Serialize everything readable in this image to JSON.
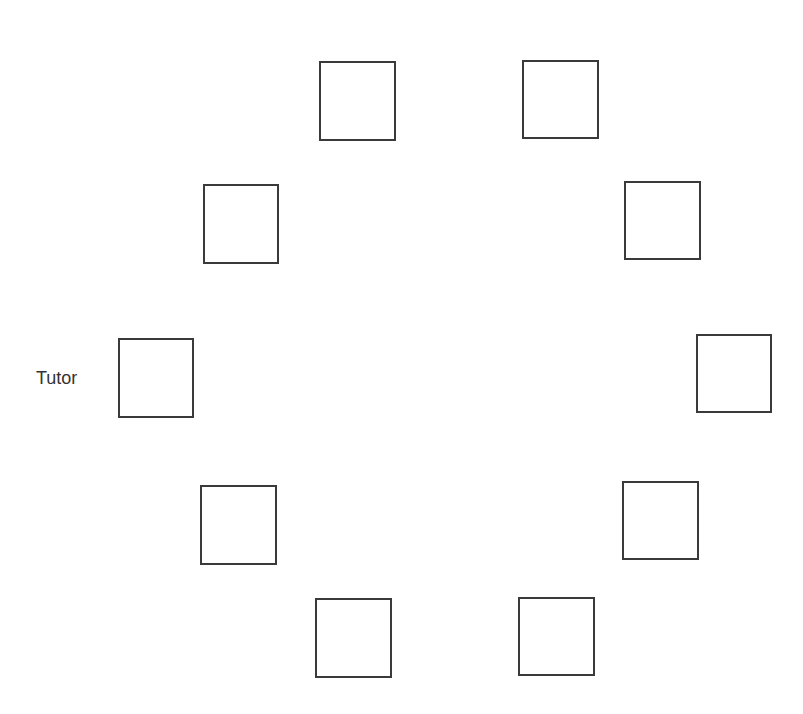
{
  "diagram": {
    "title": "",
    "tutor_label": "Tutor",
    "seats": [
      {
        "id": "seat-1",
        "x": 319,
        "y": 61,
        "w": 77,
        "h": 80
      },
      {
        "id": "seat-2",
        "x": 522,
        "y": 60,
        "w": 77,
        "h": 79
      },
      {
        "id": "seat-3",
        "x": 203,
        "y": 184,
        "w": 76,
        "h": 80
      },
      {
        "id": "seat-4",
        "x": 624,
        "y": 181,
        "w": 77,
        "h": 79
      },
      {
        "id": "seat-tutor",
        "x": 118,
        "y": 338,
        "w": 76,
        "h": 80
      },
      {
        "id": "seat-5",
        "x": 696,
        "y": 334,
        "w": 76,
        "h": 79
      },
      {
        "id": "seat-6",
        "x": 200,
        "y": 485,
        "w": 77,
        "h": 80
      },
      {
        "id": "seat-7",
        "x": 622,
        "y": 481,
        "w": 77,
        "h": 79
      },
      {
        "id": "seat-8",
        "x": 315,
        "y": 598,
        "w": 77,
        "h": 80
      },
      {
        "id": "seat-9",
        "x": 518,
        "y": 597,
        "w": 77,
        "h": 79
      }
    ],
    "colors": {
      "stroke": "#3a3a3a",
      "text": "#333333",
      "background": "#ffffff"
    }
  }
}
